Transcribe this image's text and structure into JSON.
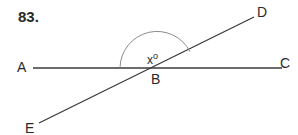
{
  "problem_number": "83.",
  "points": {
    "A": "A",
    "B": "B",
    "C": "C",
    "D": "D",
    "E": "E"
  },
  "angle_label": {
    "var": "x",
    "degree": "o"
  },
  "colors": {
    "line": "#3a3a3a",
    "arc": "#8a8a8a",
    "text": "#2a2a2a"
  }
}
